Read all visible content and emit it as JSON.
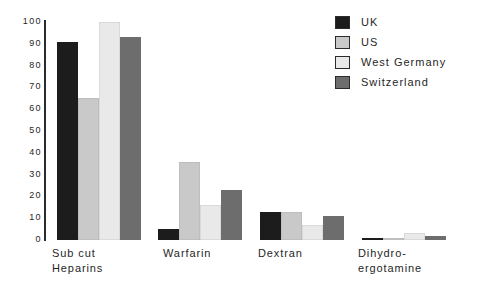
{
  "chart_data": {
    "type": "bar",
    "title": "",
    "subtitle": "",
    "xlabel": "",
    "ylabel": "",
    "ylim": [
      0,
      100
    ],
    "yticks": [
      "0",
      "10",
      "20",
      "30",
      "40",
      "50",
      "60",
      "70",
      "80",
      "90",
      "100"
    ],
    "grid": false,
    "legend_position": "top-right",
    "categories": [
      "Sub cut\nHeparins",
      "Warfarin",
      "Dextran",
      "Dihydro-\nergotamine"
    ],
    "series": [
      {
        "name": "UK",
        "color": "#1c1c1c",
        "values": [
          91,
          5,
          13,
          1
        ]
      },
      {
        "name": "US",
        "color": "#c9c9c9",
        "values": [
          65,
          36,
          13,
          1
        ]
      },
      {
        "name": "West Germany",
        "color": "#e9e9e9",
        "values": [
          100,
          16,
          7,
          3
        ]
      },
      {
        "name": "Switzerland",
        "color": "#6d6d6d",
        "values": [
          93,
          23,
          11,
          2
        ]
      }
    ]
  },
  "legend": {
    "items": [
      {
        "label": "UK"
      },
      {
        "label": "US"
      },
      {
        "label": "West Germany"
      },
      {
        "label": "Switzerland"
      }
    ]
  },
  "axis": {
    "axis_color": "#2b2b2b"
  }
}
